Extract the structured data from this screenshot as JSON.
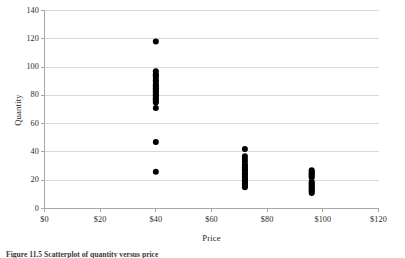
{
  "figure": {
    "caption_label": "Figure 11.5",
    "caption_text": "Figure 11.5 Scatterplot of quantity versus price"
  },
  "chart_data": {
    "type": "scatter",
    "title": "",
    "xlabel": "Price",
    "ylabel": "Quantity",
    "xlim": [
      0,
      120
    ],
    "ylim": [
      0,
      140
    ],
    "xticks": [
      0,
      20,
      40,
      60,
      80,
      100,
      120
    ],
    "xtick_labels": [
      "$0",
      "$20",
      "$40",
      "$60",
      "$80",
      "$100",
      "$120"
    ],
    "yticks": [
      0,
      20,
      40,
      60,
      80,
      100,
      120,
      140
    ],
    "ytick_labels": [
      "0",
      "20",
      "40",
      "60",
      "80",
      "100",
      "120",
      "140"
    ],
    "grid": "horizontal",
    "grid_color": "#d9d9d9",
    "axis_color": "#a6a6a6",
    "marker": "circle",
    "marker_color": "#000000",
    "marker_size": 4.2,
    "legend": "none",
    "series": [
      {
        "name": "Quantity vs Price",
        "points": [
          [
            40,
            118
          ],
          [
            40,
            97
          ],
          [
            40,
            95
          ],
          [
            40,
            94
          ],
          [
            40,
            93
          ],
          [
            40,
            91
          ],
          [
            40,
            90
          ],
          [
            40,
            88
          ],
          [
            40,
            87
          ],
          [
            40,
            86
          ],
          [
            40,
            85
          ],
          [
            40,
            84
          ],
          [
            40,
            83
          ],
          [
            40,
            82
          ],
          [
            40,
            81
          ],
          [
            40,
            80
          ],
          [
            40,
            79
          ],
          [
            40,
            78
          ],
          [
            40,
            77
          ],
          [
            40,
            76
          ],
          [
            40,
            75
          ],
          [
            40,
            71
          ],
          [
            40,
            47
          ],
          [
            40,
            26
          ],
          [
            72,
            42
          ],
          [
            72,
            37
          ],
          [
            72,
            35
          ],
          [
            72,
            33
          ],
          [
            72,
            31
          ],
          [
            72,
            30
          ],
          [
            72,
            29
          ],
          [
            72,
            28
          ],
          [
            72,
            27
          ],
          [
            72,
            26
          ],
          [
            72,
            25
          ],
          [
            72,
            24
          ],
          [
            72,
            23
          ],
          [
            72,
            22
          ],
          [
            72,
            21
          ],
          [
            72,
            20
          ],
          [
            72,
            19
          ],
          [
            72,
            18
          ],
          [
            72,
            17
          ],
          [
            72,
            16
          ],
          [
            72,
            15
          ],
          [
            96,
            27
          ],
          [
            96,
            26
          ],
          [
            96,
            25
          ],
          [
            96,
            24
          ],
          [
            96,
            23
          ],
          [
            96,
            22
          ],
          [
            96,
            19
          ],
          [
            96,
            18
          ],
          [
            96,
            17
          ],
          [
            96,
            16
          ],
          [
            96,
            15
          ],
          [
            96,
            14
          ],
          [
            96,
            13
          ],
          [
            96,
            12
          ],
          [
            96,
            11
          ]
        ]
      }
    ]
  }
}
